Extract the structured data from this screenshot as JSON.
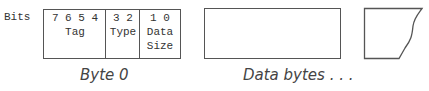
{
  "diagram": {
    "bits_label": "Bits",
    "byte0": {
      "caption": "Byte 0",
      "fields": [
        {
          "bits": "7 6 5 4",
          "name": "Tag"
        },
        {
          "bits": "3 2",
          "name": "Type"
        },
        {
          "bits": "1 0",
          "name_line1": "Data",
          "name_line2": "Size"
        }
      ]
    },
    "data_bytes": {
      "caption": "Data bytes . . ."
    },
    "colors": {
      "line": "#555555",
      "text": "#333333",
      "background": "#ffffff"
    }
  }
}
